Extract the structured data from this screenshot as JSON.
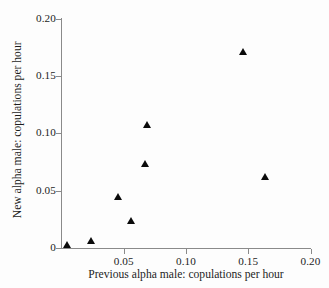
{
  "chart_data": {
    "type": "scatter",
    "title": "",
    "xlabel": "Previous alpha male: copulations per hour",
    "ylabel": "New alpha male: copulations per hour",
    "xlim": [
      0,
      0.2
    ],
    "ylim": [
      0,
      0.2
    ],
    "xticks": [
      "0",
      "0.05",
      "0.10",
      "0.15",
      "0.20"
    ],
    "xtick_values": [
      0,
      0.05,
      0.1,
      0.15,
      0.2
    ],
    "yticks": [
      "0",
      "0.05",
      "0.10",
      "0.15",
      "0.20"
    ],
    "ytick_values": [
      0,
      0.05,
      0.1,
      0.15,
      0.2
    ],
    "grid": false,
    "legend": false,
    "marker": "triangle-up",
    "marker_color": "#0a0a0a",
    "series": [
      {
        "name": "alpha male copulation rates",
        "points": [
          {
            "x": 0.005,
            "y": 0.003
          },
          {
            "x": 0.024,
            "y": 0.006
          },
          {
            "x": 0.046,
            "y": 0.045
          },
          {
            "x": 0.056,
            "y": 0.024
          },
          {
            "x": 0.067,
            "y": 0.073
          },
          {
            "x": 0.069,
            "y": 0.107
          },
          {
            "x": 0.146,
            "y": 0.171
          },
          {
            "x": 0.164,
            "y": 0.062
          }
        ]
      }
    ]
  },
  "axis_color": "#8a8a8a",
  "text_color": "#1d1d1d",
  "background_color": "#fdfdfd"
}
